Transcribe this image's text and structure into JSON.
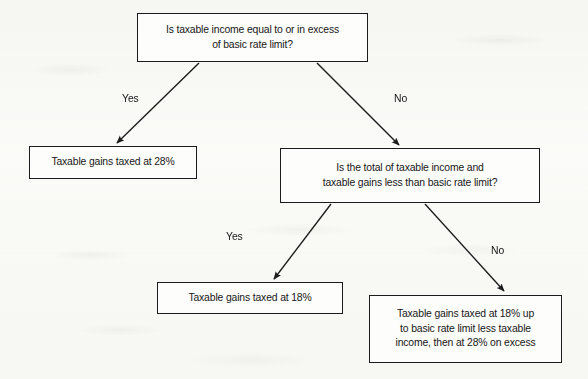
{
  "diagram": {
    "type": "flowchart",
    "nodes": [
      {
        "id": "root",
        "kind": "decision",
        "lines": [
          "Is taxable income equal to or in excess",
          "of basic rate limit?"
        ]
      },
      {
        "id": "gains28",
        "kind": "outcome",
        "lines": [
          "Taxable gains taxed at 28%"
        ]
      },
      {
        "id": "decision2",
        "kind": "decision",
        "lines": [
          "Is the total of taxable income and",
          "taxable gains less than basic rate limit?"
        ]
      },
      {
        "id": "gains18",
        "kind": "outcome",
        "lines": [
          "Taxable gains taxed at 18%"
        ]
      },
      {
        "id": "gainsSplit",
        "kind": "outcome",
        "lines": [
          "Taxable gains taxed at 18% up",
          "to basic rate limit less taxable",
          "income, then at 28% on excess"
        ]
      }
    ],
    "edges": [
      {
        "id": "root-yes",
        "from": "root",
        "to": "gains28",
        "label": "Yes"
      },
      {
        "id": "root-no",
        "from": "root",
        "to": "decision2",
        "label": "No"
      },
      {
        "id": "d2-yes",
        "from": "decision2",
        "to": "gains18",
        "label": "Yes"
      },
      {
        "id": "d2-no",
        "from": "decision2",
        "to": "gainsSplit",
        "label": "No"
      }
    ],
    "colors": {
      "stroke": "#1b1b1b",
      "text": "#171717",
      "box_fill": "#fdfdfb",
      "page_background": "#fbfbf9"
    }
  }
}
